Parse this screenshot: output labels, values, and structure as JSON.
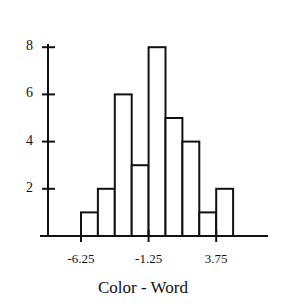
{
  "chart_data": {
    "type": "bar",
    "subtype": "histogram",
    "title": "",
    "xlabel": "Color - Word",
    "ylabel": "",
    "bin_start": -6.25,
    "bin_width": 1.25,
    "bins": [
      {
        "from": -6.25,
        "to": -5.0,
        "count": 1
      },
      {
        "from": -5.0,
        "to": -3.75,
        "count": 2
      },
      {
        "from": -3.75,
        "to": -2.5,
        "count": 6
      },
      {
        "from": -2.5,
        "to": -1.25,
        "count": 3
      },
      {
        "from": -1.25,
        "to": 0.0,
        "count": 8
      },
      {
        "from": 0.0,
        "to": 1.25,
        "count": 5
      },
      {
        "from": 1.25,
        "to": 2.5,
        "count": 4
      },
      {
        "from": 2.5,
        "to": 3.75,
        "count": 1
      },
      {
        "from": 3.75,
        "to": 5.0,
        "count": 2
      }
    ],
    "values": [
      1,
      2,
      6,
      3,
      8,
      5,
      4,
      1,
      2
    ],
    "x_ticks": [
      "-6.25",
      "-1.25",
      "3.75"
    ],
    "y_ticks": [
      "2",
      "4",
      "6",
      "8"
    ],
    "ylim": [
      0,
      8
    ],
    "grid": false,
    "legend": null
  }
}
